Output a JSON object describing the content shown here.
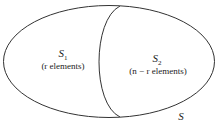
{
  "diagram": {
    "universe": {
      "label": "S"
    },
    "regions": [
      {
        "name": "S",
        "sub": "1",
        "description": "(r elements)",
        "desc_var": "r"
      },
      {
        "name": "S",
        "sub": "2",
        "description": "(n − r elements)",
        "desc_var": "n − r"
      }
    ],
    "stroke_color": "#333333"
  }
}
